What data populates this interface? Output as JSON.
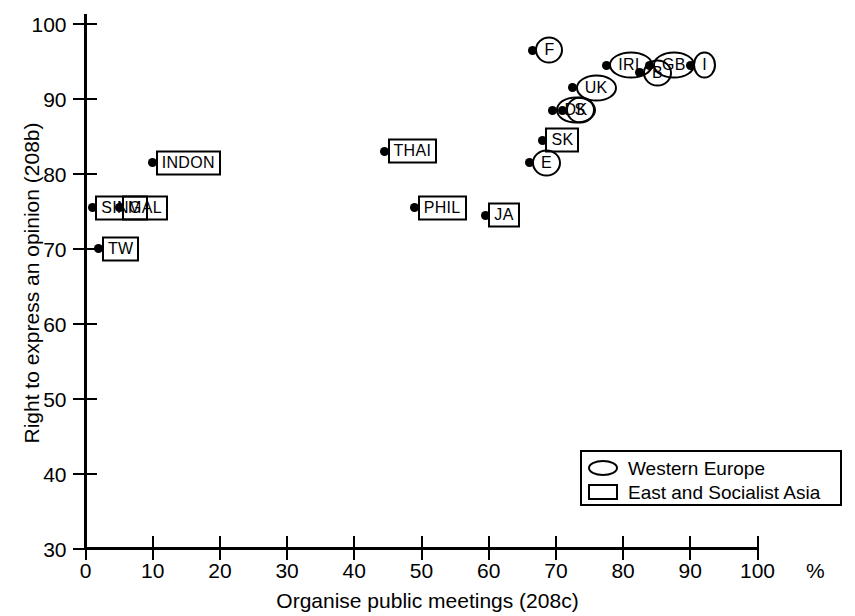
{
  "chart_data": {
    "type": "scatter",
    "title": "",
    "xlabel": "Organise public meetings (208c)",
    "ylabel": "Right to express an opinion (208b)",
    "xlim": [
      0,
      100
    ],
    "ylim": [
      30,
      100
    ],
    "x_unit": "%",
    "x_ticks": [
      0,
      10,
      20,
      30,
      40,
      50,
      60,
      70,
      80,
      90,
      100
    ],
    "y_ticks": [
      30,
      40,
      50,
      60,
      70,
      80,
      90,
      100
    ],
    "grid": false,
    "legend_position": "bottom-right",
    "legend": [
      {
        "marker": "ellipse",
        "label": "Western Europe"
      },
      {
        "marker": "rect",
        "label": "East and Socialist Asia"
      }
    ],
    "series": [
      {
        "name": "East and Socialist Asia",
        "marker": "rect",
        "points": [
          {
            "label": "SING",
            "x": 1.0,
            "y": 75.5
          },
          {
            "label": "TW",
            "x": 2.0,
            "y": 70.0
          },
          {
            "label": "MAL",
            "x": 5.0,
            "y": 75.5
          },
          {
            "label": "INDON",
            "x": 10.0,
            "y": 81.5
          },
          {
            "label": "THAI",
            "x": 44.5,
            "y": 83.0
          },
          {
            "label": "PHIL",
            "x": 49.0,
            "y": 75.5
          },
          {
            "label": "JA",
            "x": 59.5,
            "y": 74.5
          },
          {
            "label": "SK",
            "x": 68.0,
            "y": 84.5
          }
        ]
      },
      {
        "name": "Western Europe",
        "marker": "ellipse",
        "points": [
          {
            "label": "E",
            "x": 66.0,
            "y": 81.5
          },
          {
            "label": "F",
            "x": 66.5,
            "y": 96.5
          },
          {
            "label": "DK",
            "x": 69.5,
            "y": 88.5
          },
          {
            "label": "S",
            "x": 71.0,
            "y": 88.5
          },
          {
            "label": "UK",
            "x": 72.5,
            "y": 91.5
          },
          {
            "label": "IRL",
            "x": 77.5,
            "y": 94.5
          },
          {
            "label": "B",
            "x": 82.5,
            "y": 93.5
          },
          {
            "label": "GB",
            "x": 84.0,
            "y": 94.5
          },
          {
            "label": "I",
            "x": 90.0,
            "y": 94.5
          }
        ]
      }
    ]
  },
  "axis": {
    "x_tick_labels": [
      "0",
      "10",
      "20",
      "30",
      "40",
      "50",
      "60",
      "70",
      "80",
      "90",
      "100"
    ],
    "y_tick_labels": [
      "30",
      "40",
      "50",
      "60",
      "70",
      "80",
      "90",
      "100"
    ],
    "x_unit_label": "%",
    "x_title": "Organise public meetings (208c)",
    "y_title": "Right to express an opinion (208b)"
  },
  "legend": {
    "western_europe": "Western Europe",
    "east_socialist_asia": "East and Socialist Asia"
  }
}
